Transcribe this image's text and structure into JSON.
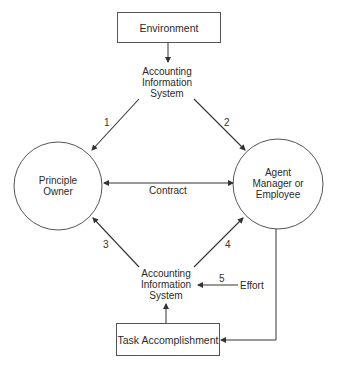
{
  "diagram": {
    "environment_box": {
      "label": "Environment"
    },
    "ais_top": {
      "lines": [
        "Accounting",
        "Information",
        "System"
      ]
    },
    "principal": {
      "lines": [
        "Principle",
        "Owner"
      ]
    },
    "agent": {
      "lines": [
        "Agent",
        "Manager or",
        "Employee"
      ]
    },
    "contract": {
      "label": "Contract"
    },
    "ais_bottom": {
      "lines": [
        "Accounting",
        "Information",
        "System"
      ]
    },
    "task_box": {
      "label": "Task Accomplishment"
    },
    "effort": {
      "label": "Effort",
      "number": "5"
    },
    "arrows": [
      {
        "id": "1",
        "from": "AIS (top)",
        "to": "Principle Owner"
      },
      {
        "id": "2",
        "from": "AIS (top)",
        "to": "Agent Manager or Employee"
      },
      {
        "id": "3",
        "from": "AIS (bottom)",
        "to": "Principle Owner"
      },
      {
        "id": "4",
        "from": "AIS (bottom)",
        "to": "Agent Manager or Employee"
      },
      {
        "id": "5",
        "from": "Effort",
        "to": "AIS (bottom)"
      }
    ],
    "stroke_color": "#3a3a3a",
    "background_color": "#ffffff"
  }
}
